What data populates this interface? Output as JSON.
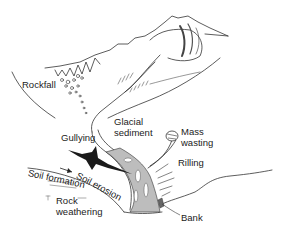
{
  "diagram": {
    "type": "illustration",
    "labels": {
      "rockfall": "Rockfall",
      "glacial_sediment_line1": "Glacial",
      "glacial_sediment_line2": "sediment",
      "gullying": "Gullying",
      "mass_wasting_line1": "Mass",
      "mass_wasting_line2": "wasting",
      "rilling": "Rilling",
      "soil_formation": "Soil formation",
      "soil_erosion": "Soil erosion",
      "rock_weathering_line1": "Rock",
      "rock_weathering_line2": "weathering",
      "bank": "Bank"
    },
    "colors": {
      "line": "#333333",
      "channel_fill": "#bdbdbd",
      "dark_feature": "#1a1a1a",
      "background": "#ffffff"
    }
  }
}
